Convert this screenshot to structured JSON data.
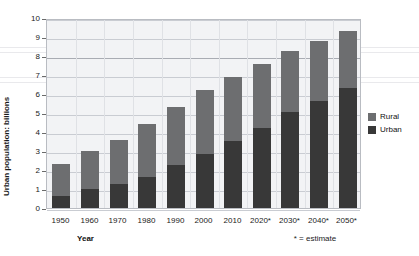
{
  "chart_data": {
    "type": "bar",
    "subtype": "stacked-column",
    "title": "",
    "xlabel": "Year",
    "ylabel": "Urban population: billions",
    "ylim": [
      0,
      10
    ],
    "ytick_step": 1,
    "ytick_labels": [
      "0",
      "1",
      "2",
      "3",
      "4",
      "5",
      "6",
      "7",
      "8",
      "9",
      "10"
    ],
    "grid": true,
    "grid_orientation": "horizontal",
    "legend_position": "right",
    "categories": [
      "1950",
      "1960",
      "1970",
      "1980",
      "1990",
      "2000",
      "2010",
      "2020*",
      "2030*",
      "2040*",
      "2050*"
    ],
    "series": [
      {
        "name": "Urban",
        "color": "#383838",
        "values": [
          0.65,
          1.0,
          1.25,
          1.65,
          2.25,
          2.85,
          3.5,
          4.2,
          5.05,
          5.65,
          6.3
        ]
      },
      {
        "name": "Rural",
        "color": "#6d6e70",
        "values": [
          1.65,
          2.0,
          2.35,
          2.75,
          3.05,
          3.35,
          3.4,
          3.4,
          3.2,
          3.15,
          3.0
        ]
      }
    ],
    "totals": [
      2.3,
      3.0,
      3.6,
      4.4,
      5.3,
      6.2,
      6.9,
      7.6,
      8.25,
      8.8,
      9.3
    ],
    "annotations": [
      "* = estimate"
    ]
  },
  "axes": {
    "y_title": "Urban population: billions",
    "x_title": "Year",
    "ticks": [
      "10",
      "9",
      "8",
      "7",
      "6",
      "5",
      "4",
      "3",
      "2",
      "1",
      "0"
    ]
  },
  "legend": {
    "items": [
      {
        "label": "Rural",
        "color": "#6d6e70"
      },
      {
        "label": "Urban",
        "color": "#383838"
      }
    ]
  },
  "footnote": {
    "text": "* = estimate"
  },
  "colors": {
    "urban": "#383838",
    "rural": "#6d6e70",
    "plot_background": "#f2f3f5",
    "grid": "#c9ccd2",
    "frame": "#b9bcc2"
  }
}
